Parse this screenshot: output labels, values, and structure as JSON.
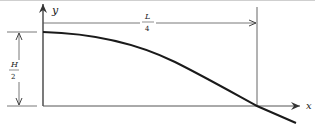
{
  "diagram": {
    "axes": {
      "y_label": "y",
      "x_label": "x"
    },
    "dimensions": {
      "horizontal": {
        "numerator": "L",
        "denominator": "4"
      },
      "vertical": {
        "numerator": "H",
        "denominator": "2"
      }
    },
    "colors": {
      "line": "#222222",
      "thin_line": "#555555",
      "background": "#ffffff"
    }
  }
}
